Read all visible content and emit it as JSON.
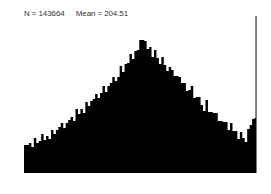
{
  "stats": {
    "n_label": "N = 143664",
    "mean_label": "Mean = 204.51"
  },
  "colors": {
    "bars": "#000000",
    "background": "#ffffff",
    "text": "#333333"
  },
  "plot_area": {
    "x0": 24,
    "x1": 257,
    "baseline": 173
  },
  "chart_data": {
    "type": "bar",
    "title": "",
    "subtitle": "N = 143664   Mean = 204.51",
    "xlabel": "",
    "ylabel": "",
    "grid": false,
    "legend": null,
    "annotations": [
      "N = 143664",
      "Mean = 204.51"
    ],
    "bin_tops_px": [
      148,
      146,
      142,
      144,
      140,
      143,
      139,
      137,
      141,
      135,
      136,
      132,
      134,
      128,
      130,
      124,
      127,
      120,
      122,
      117,
      119,
      112,
      115,
      108,
      110,
      104,
      106,
      99,
      102,
      95,
      97,
      90,
      88,
      92,
      84,
      86,
      78,
      80,
      74,
      68,
      72,
      62,
      66,
      55,
      58,
      48,
      52,
      40,
      38,
      44,
      50,
      46,
      54,
      52,
      58,
      62,
      60,
      66,
      70,
      64,
      72,
      76,
      74,
      80,
      84,
      82,
      88,
      92,
      86,
      96,
      100,
      98,
      104,
      108,
      102,
      112,
      110,
      116,
      114,
      120,
      118,
      124,
      122,
      128,
      126,
      132,
      130,
      136,
      134,
      138,
      140,
      132,
      126,
      118,
      16
    ],
    "bin_tops_note": "Top y pixel of each bar (baseline y=173); smaller = taller. Bars span x 24–257."
  }
}
